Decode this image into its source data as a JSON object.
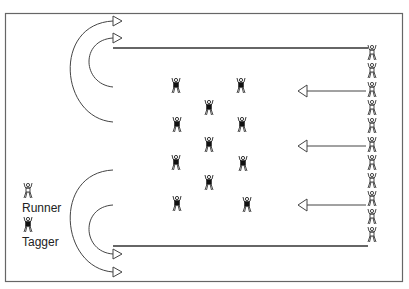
{
  "diagram": {
    "frame": {
      "x": 5,
      "y": 13,
      "width": 398,
      "height": 269,
      "color": "#555555"
    },
    "colors": {
      "line": "#444444",
      "figure_outline": "#333333",
      "tagger_fill": "#111111"
    },
    "legend": {
      "runner_label": "Runner",
      "tagger_label": "Tagger"
    },
    "boundary_lines": [
      {
        "name": "top-boundary-line",
        "x1": 113,
        "y1": 48,
        "x2": 368,
        "y2": 48
      },
      {
        "name": "bottom-boundary-line",
        "x1": 113,
        "y1": 246,
        "x2": 368,
        "y2": 246
      }
    ],
    "curved_arrows": [
      {
        "name": "top-outer-curved-arrow",
        "start_y": 122,
        "end_y": 21,
        "left_x": 64,
        "x": 113
      },
      {
        "name": "top-inner-curved-arrow",
        "start_y": 87,
        "end_y": 38,
        "left_x": 89,
        "x": 113
      },
      {
        "name": "bottom-outer-curved-arrow",
        "start_y": 170,
        "end_y": 272,
        "left_x": 64,
        "x": 113
      },
      {
        "name": "bottom-inner-curved-arrow",
        "start_y": 205,
        "end_y": 254,
        "left_x": 89,
        "x": 113
      }
    ],
    "straight_arrows": [
      {
        "name": "arrow-1",
        "x_head": 298,
        "x_tail": 366,
        "y": 91
      },
      {
        "name": "arrow-2",
        "x_head": 298,
        "x_tail": 366,
        "y": 146
      },
      {
        "name": "arrow-3",
        "x_head": 298,
        "x_tail": 366,
        "y": 205
      }
    ],
    "runners": [
      {
        "x": 372,
        "y": 53
      },
      {
        "x": 372,
        "y": 71
      },
      {
        "x": 372,
        "y": 90
      },
      {
        "x": 372,
        "y": 108
      },
      {
        "x": 372,
        "y": 126
      },
      {
        "x": 372,
        "y": 145
      },
      {
        "x": 372,
        "y": 163
      },
      {
        "x": 372,
        "y": 181
      },
      {
        "x": 372,
        "y": 199
      },
      {
        "x": 372,
        "y": 217
      },
      {
        "x": 372,
        "y": 235
      }
    ],
    "taggers": [
      {
        "x": 176,
        "y": 86
      },
      {
        "x": 241,
        "y": 86
      },
      {
        "x": 209,
        "y": 108
      },
      {
        "x": 177,
        "y": 125
      },
      {
        "x": 242,
        "y": 125
      },
      {
        "x": 209,
        "y": 145
      },
      {
        "x": 176,
        "y": 163
      },
      {
        "x": 243,
        "y": 164
      },
      {
        "x": 209,
        "y": 183
      },
      {
        "x": 177,
        "y": 204
      },
      {
        "x": 247,
        "y": 205
      }
    ],
    "legend_runner_icon": {
      "x": 28,
      "y": 191
    },
    "legend_tagger_icon": {
      "x": 28,
      "y": 225
    }
  }
}
